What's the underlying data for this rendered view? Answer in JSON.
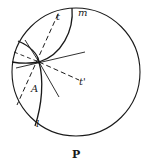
{
  "diagram": {
    "caption": "P",
    "labels": {
      "t": "t",
      "m": "m",
      "t_prime": "t'",
      "A": "A",
      "l": "l"
    },
    "circle": {
      "cx": 76,
      "cy": 72,
      "r": 64
    },
    "intersection_point": {
      "x": 39,
      "y": 62
    },
    "stroke_color": "#1a1a1a",
    "background": "#ffffff"
  }
}
